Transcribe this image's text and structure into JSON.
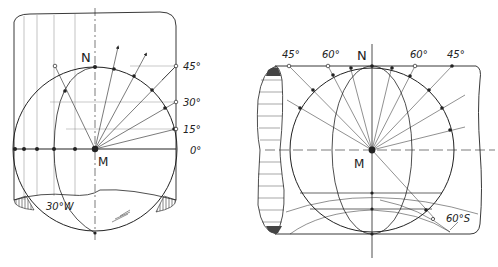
{
  "figures": {
    "left": {
      "labels": {
        "north": "N",
        "center": "M",
        "lat_45": "45°",
        "lat_30": "30°",
        "lat_15": "15°",
        "lat_0": "0°",
        "meridian": "30°W"
      }
    },
    "right": {
      "labels": {
        "north": "N",
        "center": "M",
        "top_left_45": "45°",
        "top_left_60": "60°",
        "top_right_60": "60°",
        "top_right_45": "45°",
        "south": "60°S"
      }
    }
  },
  "colors": {
    "stroke": "#222222",
    "background": "#ffffff"
  }
}
